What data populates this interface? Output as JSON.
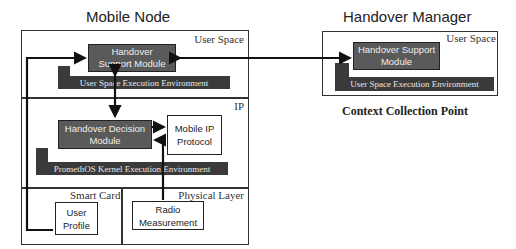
{
  "mobile_node": {
    "title": "Mobile Node",
    "user_space": {
      "label": "User Space",
      "module": "Handover Support Module",
      "env": "User Space Execution Environment"
    },
    "ip": {
      "label": "IP",
      "decision_module": "Handover Decision Module",
      "mobile_ip": "Mobile IP Protocol",
      "env": "PromethOS Kernel Execution Environment"
    },
    "smart_card": {
      "label": "Smart Card",
      "user_profile": "User Profile"
    },
    "physical_layer": {
      "label": "Physical Layer",
      "radio": "Radio Measurement"
    }
  },
  "handover_manager": {
    "title": "Handover Manager",
    "user_space": {
      "label": "User Space",
      "module": "Handover Support Module",
      "env": "User Space Execution Environment"
    },
    "caption": "Context Collection Point"
  },
  "colors": {
    "dark_module": "#5a5a5a",
    "env_bar": "#3a3a3a",
    "line": "#111111"
  }
}
